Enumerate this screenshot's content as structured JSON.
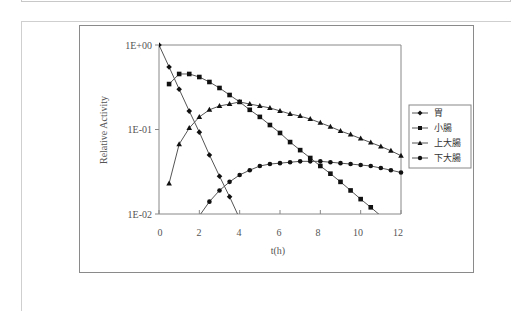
{
  "chart_data": {
    "type": "line",
    "title": "",
    "xlabel": "t(h)",
    "ylabel": "Relative Activity",
    "yscale": "log",
    "ylim": [
      0.01,
      1
    ],
    "xlim": [
      0,
      12
    ],
    "x_ticks": [
      0,
      2,
      4,
      6,
      8,
      10,
      12
    ],
    "y_ticks": [
      "1E-02",
      "1E-01",
      "1E+00"
    ],
    "grid": false,
    "legend_position": "right",
    "series": [
      {
        "name": "胃",
        "marker": "diamond",
        "x": [
          0,
          0.5,
          1,
          1.5,
          2,
          2.5,
          3,
          3.5,
          4
        ],
        "values": [
          1.0,
          0.55,
          0.3,
          0.165,
          0.093,
          0.05,
          0.028,
          0.016,
          0.0088
        ]
      },
      {
        "name": "小腸",
        "marker": "square",
        "x": [
          0.5,
          1,
          1.5,
          2,
          2.5,
          3,
          3.5,
          4,
          4.5,
          5,
          5.5,
          6,
          6.5,
          7,
          7.5,
          8,
          8.5,
          9,
          9.5,
          10,
          10.5,
          11
        ],
        "values": [
          0.345,
          0.454,
          0.454,
          0.418,
          0.365,
          0.31,
          0.256,
          0.212,
          0.171,
          0.141,
          0.113,
          0.091,
          0.071,
          0.057,
          0.046,
          0.037,
          0.03,
          0.024,
          0.019,
          0.015,
          0.012,
          0.0095
        ]
      },
      {
        "name": "上大腸",
        "marker": "triangle",
        "x": [
          0.5,
          1,
          1.5,
          2,
          2.5,
          3,
          3.5,
          4,
          4.5,
          5,
          5.5,
          6,
          6.5,
          7,
          7.5,
          8,
          8.5,
          9,
          9.5,
          10,
          10.5,
          11,
          11.5,
          12
        ],
        "values": [
          0.023,
          0.067,
          0.104,
          0.141,
          0.171,
          0.19,
          0.2,
          0.212,
          0.2,
          0.19,
          0.18,
          0.166,
          0.153,
          0.144,
          0.133,
          0.12,
          0.108,
          0.096,
          0.087,
          0.078,
          0.07,
          0.063,
          0.056,
          0.049
        ]
      },
      {
        "name": "下大腸",
        "marker": "circle",
        "x": [
          2,
          2.5,
          3,
          3.5,
          4,
          4.5,
          5,
          5.5,
          6,
          6.5,
          7,
          7.5,
          8,
          8.5,
          9,
          9.5,
          10,
          10.5,
          11,
          11.5,
          12
        ],
        "values": [
          0.0095,
          0.014,
          0.019,
          0.024,
          0.029,
          0.033,
          0.037,
          0.039,
          0.04,
          0.041,
          0.042,
          0.042,
          0.042,
          0.041,
          0.04,
          0.039,
          0.038,
          0.037,
          0.035,
          0.033,
          0.031
        ]
      }
    ]
  },
  "labels": {
    "ylabel": "Relative Activity",
    "xlabel": "t(h)",
    "y_ticks": [
      "1E+00",
      "1E-01",
      "1E-02"
    ],
    "x_ticks": [
      "0",
      "2",
      "4",
      "6",
      "8",
      "10",
      "12"
    ],
    "legend": [
      "胃",
      "小腸",
      "上大腸",
      "下大腸"
    ]
  }
}
